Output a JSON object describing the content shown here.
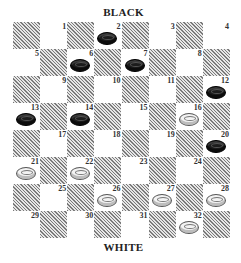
{
  "labels": {
    "top": "BLACK",
    "bottom": "WHITE"
  },
  "board": {
    "rows": 8,
    "cols": 8,
    "squares": [
      {
        "num": "1",
        "row": 0,
        "col": 1,
        "piece": null
      },
      {
        "num": "2",
        "row": 0,
        "col": 3,
        "piece": "black"
      },
      {
        "num": "3",
        "row": 0,
        "col": 5,
        "piece": null
      },
      {
        "num": "4",
        "row": 0,
        "col": 7,
        "piece": null
      },
      {
        "num": "5",
        "row": 1,
        "col": 0,
        "piece": null
      },
      {
        "num": "6",
        "row": 1,
        "col": 2,
        "piece": "black"
      },
      {
        "num": "7",
        "row": 1,
        "col": 4,
        "piece": "black"
      },
      {
        "num": "8",
        "row": 1,
        "col": 6,
        "piece": null
      },
      {
        "num": "9",
        "row": 2,
        "col": 1,
        "piece": null
      },
      {
        "num": "10",
        "row": 2,
        "col": 3,
        "piece": null
      },
      {
        "num": "11",
        "row": 2,
        "col": 5,
        "piece": null
      },
      {
        "num": "12",
        "row": 2,
        "col": 7,
        "piece": "black"
      },
      {
        "num": "13",
        "row": 3,
        "col": 0,
        "piece": "black"
      },
      {
        "num": "14",
        "row": 3,
        "col": 2,
        "piece": "black"
      },
      {
        "num": "15",
        "row": 3,
        "col": 4,
        "piece": null
      },
      {
        "num": "16",
        "row": 3,
        "col": 6,
        "piece": "white"
      },
      {
        "num": "17",
        "row": 4,
        "col": 1,
        "piece": null
      },
      {
        "num": "18",
        "row": 4,
        "col": 3,
        "piece": null
      },
      {
        "num": "19",
        "row": 4,
        "col": 5,
        "piece": null
      },
      {
        "num": "20",
        "row": 4,
        "col": 7,
        "piece": "black"
      },
      {
        "num": "21",
        "row": 5,
        "col": 0,
        "piece": "white"
      },
      {
        "num": "22",
        "row": 5,
        "col": 2,
        "piece": "white"
      },
      {
        "num": "23",
        "row": 5,
        "col": 4,
        "piece": null
      },
      {
        "num": "24",
        "row": 5,
        "col": 6,
        "piece": null
      },
      {
        "num": "25",
        "row": 6,
        "col": 1,
        "piece": null
      },
      {
        "num": "26",
        "row": 6,
        "col": 3,
        "piece": "white"
      },
      {
        "num": "27",
        "row": 6,
        "col": 5,
        "piece": "white"
      },
      {
        "num": "28",
        "row": 6,
        "col": 7,
        "piece": "white"
      },
      {
        "num": "29",
        "row": 7,
        "col": 0,
        "piece": null
      },
      {
        "num": "30",
        "row": 7,
        "col": 2,
        "piece": null
      },
      {
        "num": "31",
        "row": 7,
        "col": 4,
        "piece": null
      },
      {
        "num": "32",
        "row": 7,
        "col": 6,
        "piece": "white"
      }
    ]
  },
  "pieces": {
    "black": [
      "2",
      "6",
      "7",
      "12",
      "13",
      "14",
      "20"
    ],
    "white": [
      "16",
      "21",
      "22",
      "26",
      "27",
      "28",
      "32"
    ]
  },
  "colors": {
    "dark_square_hatch": "#7a7a7a",
    "light_square": "#ffffff",
    "black_piece": "#1c1c1c",
    "white_piece": "#f3f3f3"
  }
}
